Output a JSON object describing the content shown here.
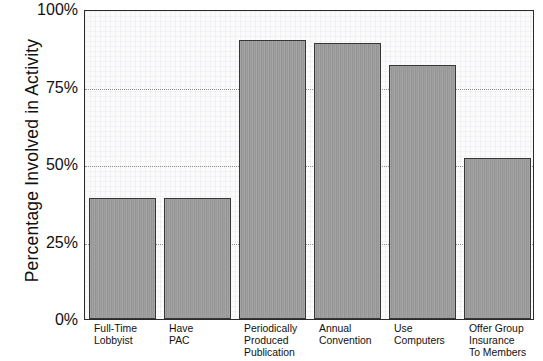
{
  "chart_data": {
    "type": "bar",
    "title": "",
    "xlabel": "",
    "ylabel": "Percentage Involved in Activity",
    "ylim": [
      0,
      100
    ],
    "yticks": [
      0,
      25,
      50,
      75,
      100
    ],
    "ytick_labels": [
      "0%",
      "25%",
      "50%",
      "75%",
      "100%"
    ],
    "grid": "horizontal-dotted",
    "legend": "none",
    "categories": [
      "Full-Time Lobbyist",
      "Have PAC",
      "Periodically Produced Publication",
      "Annual Convention",
      "Use Computers",
      "Offer Group Insurance To Members"
    ],
    "category_lines": [
      [
        "Full-Time",
        "Lobbyist"
      ],
      [
        "Have",
        "PAC"
      ],
      [
        "Periodically",
        "Produced",
        "Publication"
      ],
      [
        "Annual",
        "Convention"
      ],
      [
        "Use",
        "Computers"
      ],
      [
        "Offer Group",
        "Insurance",
        "To Members"
      ]
    ],
    "values": [
      39,
      39,
      90,
      89,
      82,
      52
    ],
    "bar_color": "#9b9b9b",
    "bar_edge_color": "#363636",
    "plot_background": "#fbfbfc",
    "axis_color": "#2b2b2b",
    "gridline_color": "#8d8d8d",
    "text_color": "#111111"
  }
}
